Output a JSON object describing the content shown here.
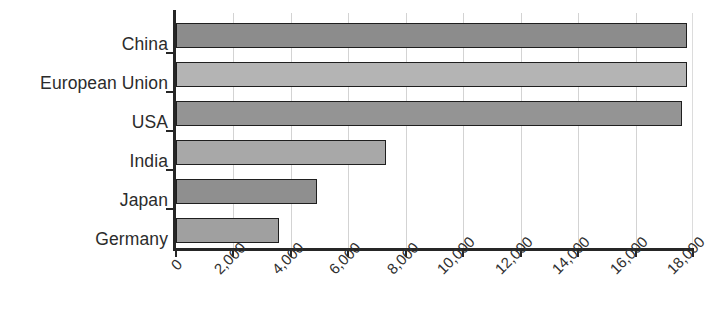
{
  "chart_data": {
    "type": "bar",
    "orientation": "horizontal",
    "title": "",
    "subtitle": "",
    "xlabel": "",
    "ylabel": "",
    "categories": [
      "China",
      "European Union",
      "USA",
      "India",
      "Japan",
      "Germany"
    ],
    "values": [
      17800,
      17800,
      17600,
      7300,
      4900,
      3600
    ],
    "series": [
      {
        "name": "",
        "values": [
          17800,
          17800,
          17600,
          7300,
          4900,
          3600
        ]
      }
    ],
    "xlim": [
      0,
      18000
    ],
    "ylim": null,
    "xticks": [
      0,
      2000,
      4000,
      6000,
      8000,
      10000,
      12000,
      14000,
      16000,
      18000
    ],
    "xtick_labels": [
      "0",
      "2,000",
      "4,000",
      "6,000",
      "8,000",
      "10,000",
      "12,000",
      "14,000",
      "16,000",
      "18,000"
    ],
    "xtick_label_rotation": -45,
    "grid": {
      "vertical": true,
      "horizontal": false,
      "color": "#d3d3d3"
    },
    "legend": {
      "visible": false,
      "position": "none",
      "entries": []
    },
    "annotations": [],
    "bar_colors": [
      "#8c8c8c",
      "#b4b4b4",
      "#949494",
      "#a8a8a8",
      "#8f8f8f",
      "#a0a0a0"
    ],
    "bar_edge_color": "#1f1f1f",
    "axis_color": "#262626",
    "background_color": "#ffffff",
    "text_color": "#2b2b2b"
  }
}
